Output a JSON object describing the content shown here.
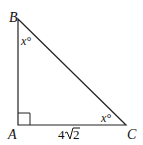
{
  "diagram": {
    "type": "right-triangle",
    "vertices": {
      "A": {
        "label": "A",
        "x": 18,
        "y": 125
      },
      "B": {
        "label": "B",
        "x": 18,
        "y": 19
      },
      "C": {
        "label": "C",
        "x": 126,
        "y": 125
      }
    },
    "angle_B": "x°",
    "angle_C": "x°",
    "side_AC": "4√2",
    "side_AC_coef": "4",
    "side_AC_radicand": "2",
    "right_angle_at": "A",
    "stroke_color": "#222222"
  }
}
